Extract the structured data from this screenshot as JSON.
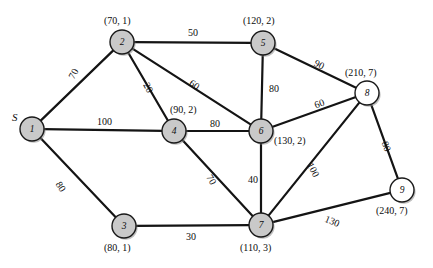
{
  "diagram": {
    "source_marker": "S",
    "colors": {
      "node_fill_gray": "#c9c9c9",
      "node_fill_white": "#ffffff",
      "node_stroke": "#1a1a1a",
      "edge_stroke": "#141414",
      "text": "#0d0d0d"
    }
  },
  "chart_data": {
    "type": "diagram",
    "title": "",
    "nodes": [
      {
        "id": "1",
        "label": "1",
        "annotation": "",
        "x": 32,
        "y": 129,
        "r": 12,
        "fill": "gray",
        "annot_x": 12,
        "annot_y": 112,
        "annot_align": "left"
      },
      {
        "id": "2",
        "label": "2",
        "annotation": "(70, 1)",
        "x": 122,
        "y": 42,
        "r": 12,
        "fill": "gray",
        "annot_x": 104,
        "annot_y": 16,
        "annot_align": "left"
      },
      {
        "id": "3",
        "label": "3",
        "annotation": "(80, 1)",
        "x": 124,
        "y": 226,
        "r": 12,
        "fill": "gray",
        "annot_x": 104,
        "annot_y": 243,
        "annot_align": "left"
      },
      {
        "id": "4",
        "label": "4",
        "annotation": "(90, 2)",
        "x": 174,
        "y": 131,
        "r": 12,
        "fill": "gray",
        "annot_x": 170,
        "annot_y": 105,
        "annot_align": "left"
      },
      {
        "id": "5",
        "label": "5",
        "annotation": "(120, 2)",
        "x": 263,
        "y": 43,
        "r": 12,
        "fill": "gray",
        "annot_x": 243,
        "annot_y": 16,
        "annot_align": "left"
      },
      {
        "id": "6",
        "label": "6",
        "annotation": "(130, 2)",
        "x": 261,
        "y": 131,
        "r": 12,
        "fill": "gray",
        "annot_x": 274,
        "annot_y": 136,
        "annot_align": "left"
      },
      {
        "id": "7",
        "label": "7",
        "annotation": "(110, 3)",
        "x": 261,
        "y": 225,
        "r": 12,
        "fill": "gray",
        "annot_x": 240,
        "annot_y": 243,
        "annot_align": "left"
      },
      {
        "id": "8",
        "label": "8",
        "annotation": "(210, 7)",
        "x": 367,
        "y": 93,
        "r": 12,
        "fill": "white",
        "annot_x": 345,
        "annot_y": 68,
        "annot_align": "left"
      },
      {
        "id": "9",
        "label": "9",
        "annotation": "(240, 7)",
        "x": 402,
        "y": 190,
        "r": 12,
        "fill": "white",
        "annot_x": 376,
        "annot_y": 206,
        "annot_align": "left"
      }
    ],
    "edges": [
      {
        "from": "1",
        "to": "2",
        "weight": "70",
        "wx": 67,
        "wy": 76,
        "rot": -62
      },
      {
        "from": "1",
        "to": "4",
        "weight": "100",
        "wx": 97,
        "wy": 117,
        "rot": 0
      },
      {
        "from": "1",
        "to": "3",
        "weight": "80",
        "wx": 62,
        "wy": 180,
        "rot": 57
      },
      {
        "from": "2",
        "to": "5",
        "weight": "50",
        "wx": 188,
        "wy": 28,
        "rot": 0
      },
      {
        "from": "2",
        "to": "4",
        "weight": "20",
        "wx": 150,
        "wy": 81,
        "rot": 62
      },
      {
        "from": "2",
        "to": "6",
        "weight": "60",
        "wx": 193,
        "wy": 78,
        "rot": 35
      },
      {
        "from": "5",
        "to": "6",
        "weight": "80",
        "wx": 269,
        "wy": 84,
        "rot": 0
      },
      {
        "from": "5",
        "to": "8",
        "weight": "90",
        "wx": 317,
        "wy": 58,
        "rot": 27
      },
      {
        "from": "4",
        "to": "6",
        "weight": "80",
        "wx": 210,
        "wy": 119,
        "rot": 0
      },
      {
        "from": "6",
        "to": "8",
        "weight": "60",
        "wx": 313,
        "wy": 101,
        "rot": -20
      },
      {
        "from": "6",
        "to": "7",
        "weight": "40",
        "wx": 248,
        "wy": 175,
        "rot": 0
      },
      {
        "from": "4",
        "to": "7",
        "weight": "70",
        "wx": 213,
        "wy": 173,
        "rot": 60
      },
      {
        "from": "3",
        "to": "7",
        "weight": "30",
        "wx": 186,
        "wy": 232,
        "rot": 0
      },
      {
        "from": "7",
        "to": "8",
        "weight": "100",
        "wx": 314,
        "wy": 161,
        "rot": 63
      },
      {
        "from": "8",
        "to": "9",
        "weight": "80",
        "wx": 389,
        "wy": 140,
        "rot": 70
      },
      {
        "from": "7",
        "to": "9",
        "weight": "130",
        "wx": 327,
        "wy": 214,
        "rot": 22
      }
    ],
    "legend": {
      "annotation_format": "(distance, predecessor)"
    }
  }
}
